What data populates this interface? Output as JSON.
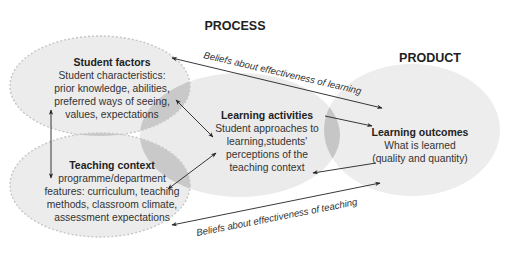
{
  "headers": {
    "process": "PROCESS",
    "product": "PRODUCT"
  },
  "nodes": {
    "student_factors": {
      "title": "Student factors",
      "lines": [
        "Student characteristics:",
        "prior knowledge, abilities,",
        "preferred ways of seeing,",
        "values, expectations"
      ]
    },
    "teaching_context": {
      "title": "Teaching context",
      "lines": [
        "programme/department",
        "features: curriculum, teaching",
        "methods, classroom climate,",
        "assessment expectations"
      ]
    },
    "learning_activities": {
      "title": "Learning activities",
      "lines": [
        "Student approaches to",
        "learning,students'",
        "perceptions of the",
        "teaching context"
      ]
    },
    "learning_outcomes": {
      "title": "Learning outcomes",
      "lines": [
        "What is learned",
        "(quality and quantity)"
      ]
    }
  },
  "edges": {
    "beliefs_learning": "Beliefs about effectiveness of learning",
    "beliefs_teaching": "Beliefs about effectiveness of teaching"
  },
  "colors": {
    "ellipse_fill": "#ebebeb",
    "overlap_fill": "#c8c8c8",
    "dashed_stroke": "#c4c4c4",
    "arrow": "#222222",
    "text": "#2a2a2a"
  }
}
